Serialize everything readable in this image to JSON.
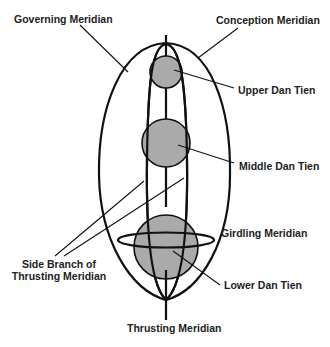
{
  "diagram": {
    "labels": {
      "governing": "Governing Meridian",
      "conception": "Conception Meridian",
      "upper": "Upper Dan Tien",
      "middle": "Middle Dan Tien",
      "girdling": "Girdling Meridian",
      "side_line1": "Side Branch of",
      "side_line2": "Thrusting Meridian",
      "lower": "Lower Dan Tien",
      "thrusting": "Thrusting Meridian"
    },
    "colors": {
      "stroke": "#111111",
      "fill": "#aaaaaa",
      "text": "#222222"
    }
  }
}
